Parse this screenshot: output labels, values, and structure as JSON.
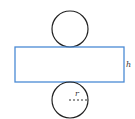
{
  "diagram": {
    "colors": {
      "circle_stroke": "#222222",
      "rect_stroke": "#4a8ad4",
      "background": "#ffffff",
      "label": "#333333"
    },
    "top_circle": {
      "cx": 70,
      "cy": 29,
      "r": 18
    },
    "rectangle": {
      "x": 15,
      "y": 47,
      "width": 109,
      "height": 35
    },
    "bottom_circle": {
      "cx": 70,
      "cy": 100,
      "r": 18
    },
    "radius_line": {
      "x1": 69,
      "y1": 100,
      "x2": 87,
      "y2": 100,
      "style": "dashed"
    },
    "labels": {
      "height": "h",
      "radius": "r"
    }
  }
}
